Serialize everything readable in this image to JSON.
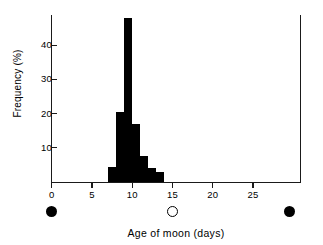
{
  "chart_data": {
    "type": "bar",
    "title": "",
    "subtitle": "",
    "xlabel": "Age of moon (days)",
    "ylabel": "Frequency (%)",
    "xlim": [
      0,
      31
    ],
    "ylim": [
      0,
      50
    ],
    "grid": false,
    "legend": "none",
    "bar_width_days": 1,
    "x_ticks": [
      0,
      5,
      10,
      15,
      20,
      25
    ],
    "x_tick_labels": [
      "0",
      "5",
      "10",
      "15",
      "20",
      "25"
    ],
    "y_ticks": [
      10,
      20,
      30,
      40
    ],
    "y_tick_labels": [
      "10",
      "20",
      "30",
      "40"
    ],
    "categories": [
      7,
      8,
      9,
      10,
      11,
      12,
      13
    ],
    "bin_starts": [
      7,
      8,
      9,
      10,
      11,
      12,
      13
    ],
    "values": [
      4.5,
      20.5,
      48,
      17,
      7.5,
      4,
      3
    ],
    "series": [
      {
        "name": "Frequency",
        "values": [
          4.5,
          20.5,
          48,
          17,
          7.5,
          4,
          3
        ],
        "color": "#000000"
      }
    ],
    "annotations": [
      {
        "name": "new-moon-start",
        "symbol": "new-moon",
        "x": 0,
        "label": ""
      },
      {
        "name": "full-moon",
        "symbol": "full-moon",
        "x": 15,
        "label": ""
      },
      {
        "name": "new-moon-end",
        "symbol": "new-moon",
        "x": 29.5,
        "label": ""
      }
    ]
  },
  "figure": {
    "axis_color": "#1a1a1a",
    "bar_color": "#000000",
    "background": "#ffffff"
  }
}
